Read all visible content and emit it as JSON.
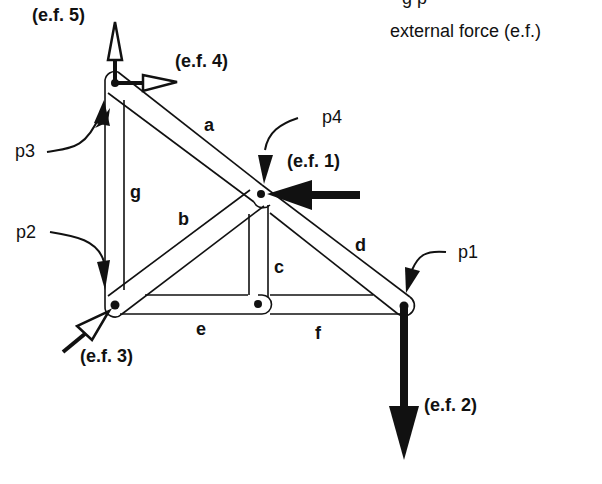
{
  "legend": {
    "cut_top_text": "g  p",
    "external_force_label": "external force (e.f.)"
  },
  "joints": [
    {
      "id": "p1",
      "label": "p1"
    },
    {
      "id": "p2",
      "label": "p2"
    },
    {
      "id": "p3",
      "label": "p3"
    },
    {
      "id": "p4",
      "label": "p4"
    }
  ],
  "members": [
    {
      "id": "a",
      "label": "a"
    },
    {
      "id": "b",
      "label": "b"
    },
    {
      "id": "c",
      "label": "c"
    },
    {
      "id": "d",
      "label": "d"
    },
    {
      "id": "e",
      "label": "e"
    },
    {
      "id": "f",
      "label": "f"
    },
    {
      "id": "g",
      "label": "g"
    }
  ],
  "external_forces": [
    {
      "id": "ef1",
      "label": "(e.f. 1)",
      "style": "filled",
      "direction": "left",
      "joint": "p4"
    },
    {
      "id": "ef2",
      "label": "(e.f. 2)",
      "style": "filled",
      "direction": "down",
      "joint": "p1"
    },
    {
      "id": "ef3",
      "label": "(e.f. 3)",
      "style": "hollow",
      "direction": "up-right",
      "joint": "p2"
    },
    {
      "id": "ef4",
      "label": "(e.f. 4)",
      "style": "hollow",
      "direction": "right",
      "joint": "p3"
    },
    {
      "id": "ef5",
      "label": "(e.f. 5)",
      "style": "hollow",
      "direction": "up",
      "joint": "p3"
    }
  ],
  "colors": {
    "ink": "#111111",
    "background": "#ffffff"
  }
}
